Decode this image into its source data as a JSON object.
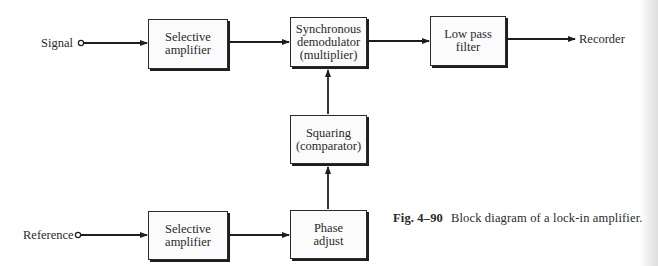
{
  "diagram": {
    "title": "Block diagram of a lock-in amplifier",
    "inputs": [
      {
        "id": "signal",
        "label": "Signal"
      },
      {
        "id": "reference",
        "label": "Reference"
      }
    ],
    "output": {
      "id": "recorder",
      "label": "Recorder"
    },
    "blocks": [
      {
        "id": "selective-amplifier-signal",
        "label": "Selective\namplifier"
      },
      {
        "id": "synchronous-demodulator",
        "label": "Synchronous\ndemodulator\n(multiplier)"
      },
      {
        "id": "low-pass-filter",
        "label": "Low pass\nfilter"
      },
      {
        "id": "squaring",
        "label": "Squaring\n(comparator)"
      },
      {
        "id": "phase-adjust",
        "label": "Phase\nadjust"
      },
      {
        "id": "selective-amplifier-reference",
        "label": "Selective\namplifier"
      }
    ],
    "connections": [
      {
        "from": "signal",
        "to": "selective-amplifier-signal"
      },
      {
        "from": "selective-amplifier-signal",
        "to": "synchronous-demodulator"
      },
      {
        "from": "synchronous-demodulator",
        "to": "low-pass-filter"
      },
      {
        "from": "low-pass-filter",
        "to": "recorder"
      },
      {
        "from": "reference",
        "to": "selective-amplifier-reference"
      },
      {
        "from": "selective-amplifier-reference",
        "to": "phase-adjust"
      },
      {
        "from": "phase-adjust",
        "to": "squaring"
      },
      {
        "from": "squaring",
        "to": "synchronous-demodulator"
      }
    ]
  },
  "caption": {
    "figure_number": "Fig. 4–90",
    "text": "Block diagram of a lock-in amplifier."
  },
  "colors": {
    "ink": "#2a2a2a",
    "paper": "#ffffff"
  }
}
